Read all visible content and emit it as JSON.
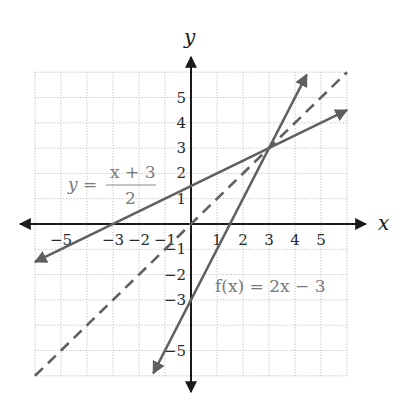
{
  "chart_data": {
    "type": "line",
    "title": "",
    "xlabel": "x",
    "ylabel": "y",
    "xlim": [
      -6,
      6
    ],
    "ylim": [
      -6,
      6
    ],
    "grid": true,
    "x_tick_labels": [
      "−5",
      "−3",
      "−2",
      "−1",
      "1",
      "2",
      "3",
      "4",
      "5"
    ],
    "x_tick_values": [
      -5,
      -3,
      -2,
      -1,
      1,
      2,
      3,
      4,
      5
    ],
    "y_tick_labels": [
      "5",
      "4",
      "3",
      "2",
      "1",
      "−1",
      "−2",
      "−3",
      "−5"
    ],
    "y_tick_values": [
      5,
      4,
      3,
      2,
      1,
      -1,
      -2,
      -3,
      -5
    ],
    "series": [
      {
        "name": "f(x) = 2x − 3",
        "equation": "f(x) = 2x - 3",
        "style": "solid",
        "points": [
          [
            -1.45,
            -5.9
          ],
          [
            4.45,
            5.9
          ]
        ],
        "x_intercept": 1.5,
        "y_intercept": -3
      },
      {
        "name": "y = (x + 3)/2",
        "equation": "y = (x + 3) / 2",
        "style": "solid",
        "points": [
          [
            -6,
            -1.5
          ],
          [
            6,
            4.5
          ]
        ],
        "x_intercept": -3,
        "y_intercept": 1.5
      },
      {
        "name": "y = x",
        "equation": "y = x",
        "style": "dashed",
        "points": [
          [
            -6,
            -6
          ],
          [
            6,
            6
          ]
        ],
        "x_intercept": 0,
        "y_intercept": 0
      }
    ],
    "annotations": [
      {
        "text": "y = (x + 3)/2",
        "near": [
          -3.5,
          2
        ]
      },
      {
        "text": "f(x) = 2x − 3",
        "near": [
          2.5,
          -2.5
        ]
      }
    ],
    "intersection": [
      3,
      3
    ]
  },
  "labels": {
    "x_axis": "x",
    "y_axis": "y",
    "eq1_lhs": "y =",
    "eq1_num": "x + 3",
    "eq1_den": "2",
    "eq2": "f(x) = 2x − 3"
  },
  "colors": {
    "axis": "#1a1a1a",
    "series": "#606060",
    "grid": "#b8b8b8",
    "equation_text": "#7a7a7a"
  }
}
